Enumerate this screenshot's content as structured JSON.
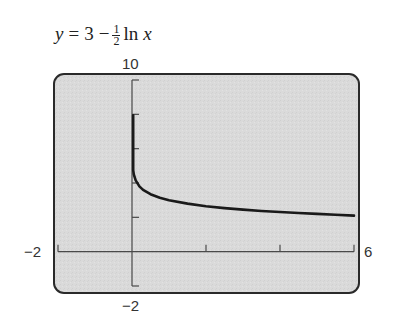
{
  "title": {
    "lhs": "y",
    "eq": "=",
    "const": "3",
    "minus": "−",
    "frac_num": "1",
    "frac_den": "2",
    "fn": "ln",
    "var": "x"
  },
  "window": {
    "xmin_label": "−2",
    "xmax_label": "6",
    "ymin_label": "−2",
    "ymax_label": "10"
  },
  "colors": {
    "screen_bg": "#dadada",
    "frame": "#2a2a2a",
    "axis": "#4a4a4a",
    "curve": "#1a1a1a"
  },
  "chart_data": {
    "type": "line",
    "xlabel": "",
    "ylabel": "",
    "xlim": [
      -2,
      6
    ],
    "ylim": [
      -2,
      10
    ],
    "x_ticks": [
      2,
      4,
      6
    ],
    "y_ticks": [
      2,
      4,
      6,
      8,
      10
    ],
    "grid": false,
    "legend": "none",
    "series": [
      {
        "name": "y = 3 − (1/2) ln x",
        "x": [
          5e-05,
          0.0001,
          0.0003,
          0.001,
          0.003,
          0.01,
          0.03,
          0.05,
          0.1,
          0.2,
          0.3,
          0.5,
          0.75,
          1,
          1.5,
          2,
          2.5,
          3,
          3.5,
          4,
          4.5,
          5,
          5.5,
          6
        ],
        "y": [
          7.95,
          7.61,
          7.06,
          6.45,
          5.9,
          5.3,
          4.75,
          4.5,
          4.15,
          3.8,
          3.6,
          3.35,
          3.14,
          3.0,
          2.8,
          2.65,
          2.54,
          2.45,
          2.37,
          2.31,
          2.25,
          2.2,
          2.15,
          2.1
        ]
      }
    ]
  }
}
